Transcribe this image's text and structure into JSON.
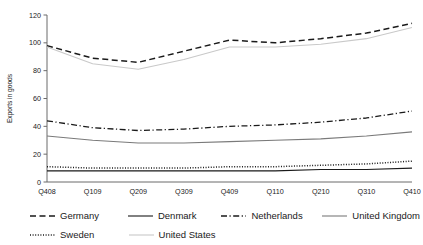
{
  "chart_data": {
    "type": "line",
    "title": "",
    "xlabel": "",
    "ylabel": "Exports in goods",
    "categories": [
      "Q408",
      "Q109",
      "Q209",
      "Q309",
      "Q409",
      "Q110",
      "Q210",
      "Q310",
      "Q410"
    ],
    "ylim": [
      0,
      120
    ],
    "yticks": [
      0,
      20,
      40,
      60,
      80,
      100,
      120
    ],
    "grid": false,
    "legend_position": "bottom",
    "series": [
      {
        "name": "Germany",
        "style": "dashed",
        "color": "#1a1a1a",
        "values": [
          98,
          89,
          86,
          94,
          102,
          100,
          103,
          107,
          114
        ]
      },
      {
        "name": "Denmark",
        "style": "solid",
        "color": "#1a1a1a",
        "values": [
          8,
          8,
          8,
          8,
          8,
          8,
          9,
          9,
          10
        ]
      },
      {
        "name": "Netherlands",
        "style": "dashdot",
        "color": "#1a1a1a",
        "values": [
          44,
          39,
          37,
          38,
          40,
          41,
          43,
          46,
          51
        ]
      },
      {
        "name": "United Kingdom",
        "style": "solid",
        "color": "#7a7a7a",
        "values": [
          33,
          30,
          28,
          28,
          29,
          30,
          31,
          33,
          36
        ]
      },
      {
        "name": "Sweden",
        "style": "dotted",
        "color": "#1a1a1a",
        "values": [
          11,
          10,
          10,
          10,
          11,
          11,
          12,
          13,
          15
        ]
      },
      {
        "name": "United States",
        "style": "solid",
        "color": "#c9c9c9",
        "values": [
          97,
          85,
          81,
          88,
          97,
          97,
          99,
          103,
          111
        ]
      }
    ]
  },
  "legend": {
    "rows": [
      [
        "Germany",
        "Denmark",
        "Netherlands",
        "United Kingdom"
      ],
      [
        "Sweden",
        "United States"
      ]
    ]
  }
}
